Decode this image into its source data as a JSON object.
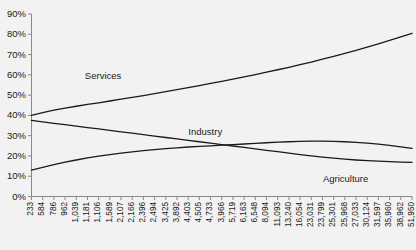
{
  "chart_data": {
    "type": "line",
    "title": "",
    "xlabel": "",
    "ylabel": "",
    "ylim": [
      0,
      90
    ],
    "grid": false,
    "legend_position": "inline-annotations",
    "ytick_labels": [
      "0%",
      "10%",
      "20%",
      "30%",
      "40%",
      "50%",
      "60%",
      "70%",
      "80%",
      "90%"
    ],
    "ytick_values": [
      0,
      10,
      20,
      30,
      40,
      50,
      60,
      70,
      80,
      90
    ],
    "categories": [
      "233",
      "584",
      "786",
      "962",
      "1,039",
      "1,181",
      "1,106",
      "1,589",
      "2,107",
      "2,166",
      "2,396",
      "2,494",
      "3,425",
      "3,892",
      "4,403",
      "4,505",
      "4,733",
      "3,966",
      "5,719",
      "6,163",
      "6,548",
      "8,094",
      "11,093",
      "13,240",
      "16,054",
      "23,031",
      "23,799",
      "25,301",
      "25,968",
      "27,033",
      "30,124",
      "31,597",
      "35,960",
      "38,962",
      "51,950"
    ],
    "series": [
      {
        "name": "Services",
        "label_text": "Services",
        "values": [
          40.0,
          41.4,
          42.6,
          43.6,
          44.5,
          45.4,
          46.2,
          47.1,
          48.0,
          48.9,
          49.8,
          50.7,
          51.7,
          52.7,
          53.7,
          54.7,
          55.8,
          56.8,
          57.9,
          59.0,
          60.1,
          61.3,
          62.5,
          63.7,
          65.0,
          66.3,
          67.7,
          69.1,
          70.6,
          72.1,
          73.7,
          75.3,
          77.0,
          78.7,
          80.5
        ]
      },
      {
        "name": "Industry",
        "label_text": "Industry",
        "values": [
          37.5,
          36.8,
          36.1,
          35.4,
          34.7,
          34.0,
          33.3,
          32.6,
          31.9,
          31.2,
          30.5,
          29.8,
          29.1,
          28.4,
          27.7,
          27.0,
          26.3,
          25.6,
          24.9,
          24.2,
          23.5,
          22.8,
          22.1,
          21.4,
          20.7,
          20.0,
          19.4,
          18.9,
          18.4,
          18.0,
          17.7,
          17.4,
          17.2,
          17.0,
          16.8
        ]
      },
      {
        "name": "Agriculture",
        "label_text": "Agriculture",
        "values": [
          13.0,
          14.4,
          15.7,
          16.9,
          18.0,
          19.0,
          19.9,
          20.7,
          21.4,
          22.0,
          22.6,
          23.1,
          23.6,
          24.0,
          24.4,
          24.7,
          25.0,
          25.3,
          25.6,
          25.9,
          26.2,
          26.5,
          26.8,
          27.0,
          27.2,
          27.3,
          27.3,
          27.2,
          27.0,
          26.7,
          26.3,
          25.8,
          25.2,
          24.5,
          23.7
        ]
      }
    ],
    "annotations": [
      {
        "text": "Services",
        "x_pct": 20.5,
        "y_pct": 28.0
      },
      {
        "text": "Industry",
        "x_pct": 45.5,
        "y_pct": 50.5
      },
      {
        "text": "Agriculture",
        "x_pct": 78.0,
        "y_pct": 69.0
      }
    ],
    "colors": {
      "line": "#1a1a1a",
      "axis": "#808080",
      "background": "#f2f2f2",
      "text": "#1a1a1a"
    }
  }
}
